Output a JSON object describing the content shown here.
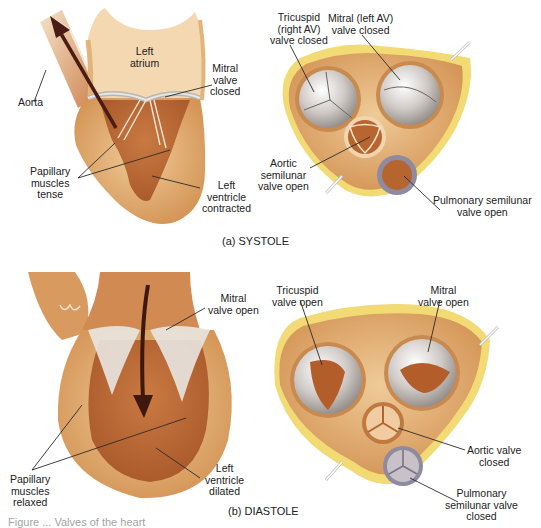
{
  "figure": {
    "caption_partial": "Figure ... Valves of the heart",
    "colors": {
      "background": "#ffffff",
      "myocardium_light": "#e9c18c",
      "myocardium_mid": "#d49a5c",
      "chamber_dark": "#b9672f",
      "fat_yellow": "#f1d66a",
      "valve_silver": "#d9d6d2",
      "arrow": "#4a1d14",
      "leader_line": "#2a2a2a"
    }
  },
  "panels": [
    {
      "id": "a",
      "caption": "(a)  SYSTOLE",
      "longitudinal": {
        "labels": {
          "aorta": "Aorta",
          "left_atrium": "Left\natrium",
          "mitral": "Mitral\nvalve\nclosed",
          "papillary": "Papillary\nmuscles\ntense",
          "left_ventricle": "Left\nventricle\ncontracted"
        },
        "arrow_direction": "up-left (into aorta)"
      },
      "cross_section": {
        "labels": {
          "tricuspid": "Tricuspid\n(right AV)\nvalve closed",
          "mitral": "Mitral (left AV)\nvalve closed",
          "aortic": "Aortic\nsemilunar\nvalve open",
          "pulmonary": "Pulmonary semilunar\nvalve open"
        }
      }
    },
    {
      "id": "b",
      "caption": "(b)  DIASTOLE",
      "longitudinal": {
        "labels": {
          "mitral": "Mitral\nvalve open",
          "papillary": "Papillary\nmuscles\nrelaxed",
          "left_ventricle": "Left\nventricle\ndilated"
        },
        "arrow_direction": "down (into ventricle)"
      },
      "cross_section": {
        "labels": {
          "tricuspid": "Tricuspid\nvalve open",
          "mitral": "Mitral\nvalve open",
          "aortic": "Aortic valve\nclosed",
          "pulmonary": "Pulmonary\nsemilunar valve\nclosed"
        }
      }
    }
  ]
}
